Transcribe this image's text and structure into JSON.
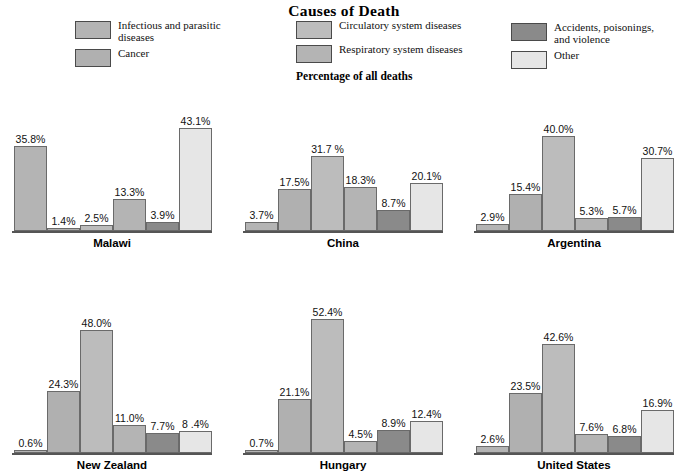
{
  "title": "Causes of Death",
  "sub_caption": "Percentage of all deaths",
  "legend": {
    "columns": [
      {
        "items": [
          {
            "label": "Infectious and parasitic\ndiseases",
            "color": "#b4b4b4",
            "swatch_name": "legend-swatch-infectious"
          },
          {
            "label": "Cancer",
            "color": "#b0b0b0",
            "swatch_name": "legend-swatch-cancer"
          }
        ]
      },
      {
        "items": [
          {
            "label": "Circulatory system diseases",
            "color": "#bcbcbc",
            "swatch_name": "legend-swatch-circulatory"
          },
          {
            "label": "Respiratory system diseases",
            "color": "#b4b4b4",
            "swatch_name": "legend-swatch-respiratory"
          }
        ]
      },
      {
        "items": [
          {
            "label": "Accidents, poisonings,\nand violence",
            "color": "#8a8a8a",
            "swatch_name": "legend-swatch-accidents"
          },
          {
            "label": "Other",
            "color": "#e6e6e6",
            "swatch_name": "legend-swatch-other"
          }
        ]
      }
    ]
  },
  "colors": {
    "infectious": "#b4b4b4",
    "cancer": "#b0b0b0",
    "circulatory": "#bcbcbc",
    "respiratory": "#b4b4b4",
    "accidents": "#8a8a8a",
    "other": "#e6e6e6",
    "bar_border": "#6a6a6a",
    "baseline": "#555555",
    "text": "#111111"
  },
  "chart_data": {
    "type": "bar",
    "title": "Causes of Death",
    "subtitle": "Percentage of all deaths",
    "xlabel": "",
    "ylabel": "Percentage of all deaths",
    "ylim": [
      0,
      55
    ],
    "grid": false,
    "legend_position": "top",
    "categories": [
      "Infectious and parasitic diseases",
      "Cancer",
      "Circulatory system diseases",
      "Respiratory system diseases",
      "Accidents, poisonings, and violence",
      "Other"
    ],
    "panels": [
      {
        "name": "Malawi",
        "values": [
          35.8,
          1.4,
          2.5,
          13.3,
          3.9,
          43.1
        ],
        "labels": [
          "35.8%",
          "1.4%",
          "2.5%",
          "13.3%",
          "3.9%",
          "43.1%"
        ]
      },
      {
        "name": "China",
        "values": [
          3.7,
          17.5,
          31.7,
          18.3,
          8.7,
          20.1
        ],
        "labels": [
          "3.7%",
          "17.5%",
          "31.7 %",
          "18.3%",
          "8.7%",
          "20.1%"
        ]
      },
      {
        "name": "Argentina",
        "values": [
          2.9,
          15.4,
          40.0,
          5.3,
          5.7,
          30.7
        ],
        "labels": [
          "2.9%",
          "15.4%",
          "40.0%",
          "5.3%",
          "5.7%",
          "30.7%"
        ]
      },
      {
        "name": "New Zealand",
        "values": [
          0.6,
          24.3,
          48.0,
          11.0,
          7.7,
          8.4
        ],
        "labels": [
          "0.6%",
          "24.3%",
          "48.0%",
          "11.0%",
          "7.7%",
          "8 .4%"
        ]
      },
      {
        "name": "Hungary",
        "values": [
          0.7,
          21.1,
          52.4,
          4.5,
          8.9,
          12.4
        ],
        "labels": [
          "0.7%",
          "21.1%",
          "52.4%",
          "4.5%",
          "8.9%",
          "12.4%"
        ]
      },
      {
        "name": "United States",
        "values": [
          2.6,
          23.5,
          42.6,
          7.6,
          6.8,
          16.9
        ],
        "labels": [
          "2.6%",
          "23.5%",
          "42.6%",
          "7.6%",
          "6.8%",
          "16.9%"
        ]
      }
    ]
  }
}
